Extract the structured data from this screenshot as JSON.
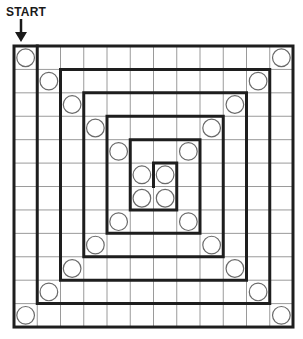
{
  "header": {
    "start_label": "START",
    "arrow_icon": "arrow-down-icon"
  },
  "board": {
    "rows": 12,
    "cols": 12,
    "origin": [
      14,
      46
    ],
    "cell_w": 23.25,
    "cell_h": 23.42,
    "colors": {
      "thin_line": "#9a9a9a",
      "thick_line": "#1e1e1e",
      "circle": "#6a6a6a",
      "background": "#ffffff"
    },
    "spaces_with_circles": [
      [
        0,
        0
      ],
      [
        0,
        11
      ],
      [
        1,
        1
      ],
      [
        1,
        10
      ],
      [
        2,
        2
      ],
      [
        2,
        9
      ],
      [
        3,
        3
      ],
      [
        3,
        8
      ],
      [
        4,
        4
      ],
      [
        4,
        7
      ],
      [
        5,
        5
      ],
      [
        5,
        6
      ],
      [
        6,
        5
      ],
      [
        6,
        6
      ],
      [
        7,
        4
      ],
      [
        7,
        7
      ],
      [
        8,
        3
      ],
      [
        8,
        8
      ],
      [
        9,
        2
      ],
      [
        9,
        9
      ],
      [
        10,
        1
      ],
      [
        10,
        10
      ],
      [
        11,
        0
      ],
      [
        11,
        11
      ]
    ],
    "spiral_wall_path": [
      [
        1,
        0
      ],
      [
        1,
        11
      ],
      [
        11,
        11
      ],
      [
        11,
        1
      ],
      [
        2,
        1
      ],
      [
        2,
        10
      ],
      [
        10,
        10
      ],
      [
        10,
        2
      ],
      [
        3,
        2
      ],
      [
        3,
        9
      ],
      [
        9,
        9
      ],
      [
        9,
        3
      ],
      [
        4,
        3
      ],
      [
        4,
        8
      ],
      [
        8,
        8
      ],
      [
        8,
        4
      ],
      [
        5,
        4
      ],
      [
        5,
        7
      ],
      [
        7,
        7
      ],
      [
        7,
        5
      ],
      [
        6,
        5
      ],
      [
        6,
        6
      ]
    ]
  }
}
